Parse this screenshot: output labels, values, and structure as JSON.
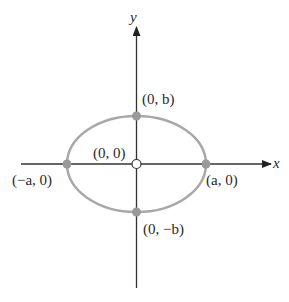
{
  "diagram": {
    "title": "",
    "axes": {
      "x_label": "x",
      "y_label": "y"
    },
    "shape": "ellipse",
    "colors": {
      "ellipse": "#a8a8a8",
      "axis": "#333333",
      "vertex_fill": "#9a9a9a",
      "center_fill": "#ffffff"
    },
    "points": {
      "center": "(0, 0)",
      "top": "(0, b)",
      "bottom": "(0, −b)",
      "left": "(−a, 0)",
      "right": "(a, 0)"
    }
  }
}
